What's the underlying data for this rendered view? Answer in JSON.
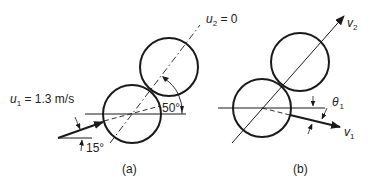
{
  "figure": {
    "panel_a": {
      "caption": "(a)",
      "u1_symbol": "u",
      "u1_subscript": "1",
      "u1_value": " = 1.3 m/s",
      "u2_symbol": "u",
      "u2_subscript": "2",
      "u2_value": " = 0",
      "angle_incoming": "15°",
      "angle_centers": "50°"
    },
    "panel_b": {
      "caption": "(b)",
      "v1_symbol": "v",
      "v1_subscript": "1",
      "v2_symbol": "v",
      "v2_subscript": "2",
      "theta_symbol": "θ",
      "theta_subscript": "1"
    },
    "colors": {
      "stroke": "#1a1a1a",
      "text": "#222222"
    }
  }
}
